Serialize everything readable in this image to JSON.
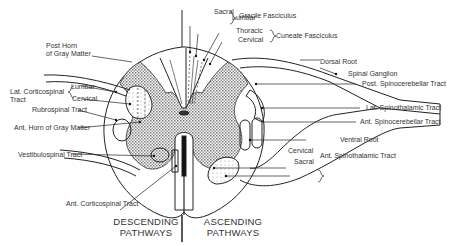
{
  "diagram": {
    "labels": {
      "sacral_top": "Sacral",
      "lumbar_top": "Lumbar",
      "gracile": "Gracile Fasciculus",
      "thoracic": "Thoracic",
      "cervical_top": "Cervical",
      "cuneate": "Cuneate Fasciculus",
      "post_horn_1": "Post Horn",
      "post_horn_2": "of Gray Matter",
      "dorsal_root": "Dorsal Root",
      "spinal_ganglion": "Spinal Ganglion",
      "post_spinocerebellar": "Post. Spinocerebellar Tract",
      "lat_corticospinal_1": "Lat. Corticospinal",
      "lat_corticospinal_2": "Tract",
      "lumbar_left": "Lumbar",
      "cervical_left": "Cervical",
      "rubrospinal": "Rubrospinal Tract",
      "lat_spinothalamic": "Lat. Spinothalamic Tract",
      "ant_spinocerebellar": "Ant. Spinocerebellar Tract",
      "ant_horn": "Ant. Horn of Gray Matter",
      "ventral_root": "Ventral Root",
      "vestibulospinal": "Vestibulospinal Tract",
      "cervical_right": "Cervical",
      "sacral_right": "Sacral",
      "ant_spinothalamic": "Ant. Spinothalamic Tract",
      "ant_corticospinal": "Ant. Corticospinal Tract",
      "descending_1": "DESCENDING",
      "descending_2": "PATHWAYS",
      "ascending_1": "ASCENDING",
      "ascending_2": "PATHWAYS"
    }
  }
}
